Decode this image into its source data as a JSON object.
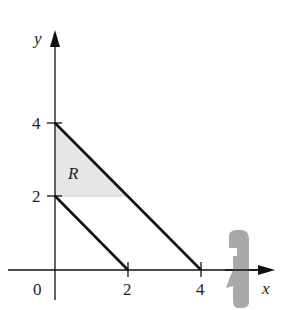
{
  "figure": {
    "axes": {
      "x_label": "x",
      "y_label": "y",
      "origin_label": "0",
      "x_ticks": [
        {
          "value": 2,
          "label": "2"
        },
        {
          "value": 4,
          "label": "4"
        }
      ],
      "y_ticks": [
        {
          "value": 2,
          "label": "2"
        },
        {
          "value": 4,
          "label": "4"
        }
      ]
    },
    "lines": [
      {
        "name": "x + y = 2",
        "from": [
          0,
          2
        ],
        "to": [
          2,
          0
        ]
      },
      {
        "name": "x + y = 4",
        "from": [
          0,
          4
        ],
        "to": [
          4,
          0
        ]
      }
    ],
    "region": {
      "label": "R",
      "vertices": [
        [
          0,
          2
        ],
        [
          0,
          4
        ],
        [
          2,
          2
        ]
      ],
      "fill_color": "#e6e6e6"
    },
    "rotation_indicator": {
      "axis": "x-axis",
      "description": "curved arrow indicating revolution about the x-axis",
      "color": "#a8a8a8"
    },
    "colors": {
      "axis": "#111111",
      "line": "#111111",
      "shade": "#e6e6e6",
      "arrow": "#a8a8a8"
    }
  }
}
